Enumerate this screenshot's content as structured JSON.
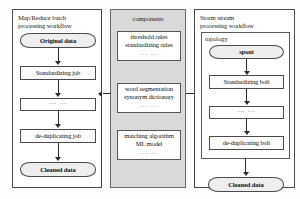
{
  "diagram": {
    "type": "flowchart",
    "panels": [
      {
        "id": "batch",
        "title": "Map/Reduce batch\nprocessing workflow",
        "title_line1": "Map/Reduce batch",
        "title_line2": "processing workflow",
        "fill": "#ffffff",
        "nodes": [
          {
            "id": "original-data",
            "label": "Original data",
            "shape": "rounded"
          },
          {
            "id": "standardizing-job",
            "label": "Standardizing job",
            "shape": "rect"
          },
          {
            "id": "batch-ellipsis",
            "label": "··· ···",
            "shape": "rect"
          },
          {
            "id": "de-duplicating-job",
            "label": "de-duplicating job",
            "shape": "rect"
          },
          {
            "id": "cleaned-data-batch",
            "label": "Cleaned data",
            "shape": "rounded"
          }
        ]
      },
      {
        "id": "components",
        "title": "components",
        "fill": "#d9d9d9",
        "nodes": [
          {
            "id": "rules-component",
            "line1": "threshold rules",
            "line2": "standardizing rules",
            "dots": "··· ···"
          },
          {
            "id": "segmentation-component",
            "line1": "word segmentation",
            "line2": "synonym dictionary",
            "dots": "··· ···"
          },
          {
            "id": "matching-component",
            "line1": "matching algorithm",
            "line2": "ML model",
            "dots": "··· ···"
          }
        ]
      },
      {
        "id": "stream",
        "title": "Storm stream\nprocessing workflow",
        "title_line1": "Storm stream",
        "title_line2": "processing workflow",
        "fill": "#ffffff",
        "group_label": "topology",
        "nodes": [
          {
            "id": "spout",
            "label": "spout",
            "shape": "rounded"
          },
          {
            "id": "standardizing-bolt",
            "label": "Standardizing bolt",
            "shape": "rect"
          },
          {
            "id": "stream-ellipsis",
            "label": "··· ···",
            "shape": "rect"
          },
          {
            "id": "de-duplicating-bolt",
            "label": "de-duplicating bolt",
            "shape": "rect"
          },
          {
            "id": "cleaned-data-stream",
            "label": "Cleaned data",
            "shape": "rounded"
          }
        ]
      }
    ],
    "connectors": [
      {
        "id": "components-to-batch",
        "direction": "left"
      },
      {
        "id": "components-to-stream",
        "direction": "right"
      }
    ],
    "colors": {
      "border": "#4a4a4a",
      "arrow": "#2b2b2b",
      "shaded_panel": "#d9d9d9",
      "node_fill": "#f2f2f2",
      "text": "#111111"
    }
  }
}
